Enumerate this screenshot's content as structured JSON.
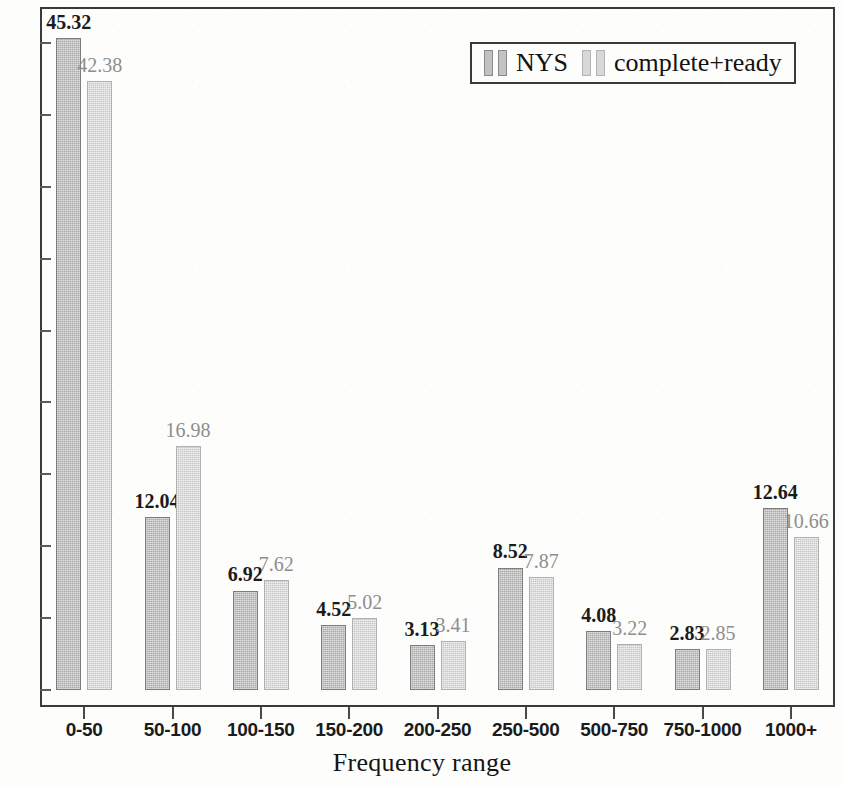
{
  "chart_data": {
    "type": "bar",
    "title": "",
    "xlabel": "Frequency range",
    "ylabel": "",
    "categories": [
      "0-50",
      "50-100",
      "100-150",
      "150-200",
      "200-250",
      "250-500",
      "500-750",
      "750-1000",
      "1000+"
    ],
    "series": [
      {
        "name": "NYS",
        "color": "#bfbfbf",
        "values": [
          45.32,
          12.04,
          6.92,
          4.52,
          3.13,
          8.52,
          4.08,
          2.83,
          12.64
        ]
      },
      {
        "name": "complete+ready",
        "color": "#d6d6d6",
        "values": [
          42.38,
          16.98,
          7.62,
          5.02,
          3.41,
          7.87,
          3.22,
          2.85,
          10.66
        ]
      }
    ],
    "ylim": [
      0,
      47.5
    ],
    "yticks": [
      0,
      5,
      10,
      15,
      20,
      25,
      30,
      35,
      40,
      45
    ],
    "ytick_labels": [
      "0",
      "5",
      "10",
      "15",
      "20",
      "25",
      "30",
      "35",
      "40",
      "45"
    ],
    "grid": false,
    "legend_position": "top-right",
    "value_labels": true
  },
  "legend": {
    "entries": [
      {
        "label": "NYS"
      },
      {
        "label": "complete+ready"
      }
    ]
  },
  "axes": {
    "x_title": "Frequency range"
  }
}
